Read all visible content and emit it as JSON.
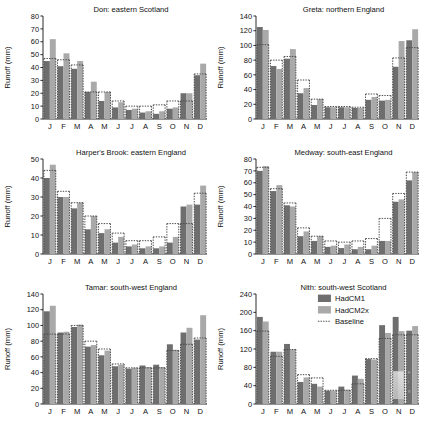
{
  "figure": {
    "axis_label": "Runoff (mm)",
    "month_labels": [
      "J",
      "F",
      "M",
      "A",
      "M",
      "J",
      "J",
      "A",
      "S",
      "O",
      "N",
      "D"
    ],
    "colors": {
      "hadcm1": "#6e6e6e",
      "hadcm2x": "#a9a9a9",
      "baseline": "#4a4a4a",
      "axis": "#2b2b2b",
      "background": "#ffffff"
    },
    "legend": {
      "position": "top-right of panel 6",
      "entries": [
        {
          "label": "HadCM1",
          "type": "swatch",
          "color": "#6e6e6e"
        },
        {
          "label": "HadCM2x",
          "type": "swatch",
          "color": "#a9a9a9"
        },
        {
          "label": "Baseline",
          "type": "dotted-line",
          "color": "#4a4a4a"
        }
      ]
    },
    "edge_caption_lines": [
      "F",
      "i",
      "g",
      "."
    ]
  },
  "chart_data": [
    {
      "type": "bar",
      "panel": 1,
      "title": "Don: eastern Scotland",
      "xlabel": "",
      "ylabel": "Runoff (mm)",
      "ylim": [
        0,
        80
      ],
      "yticks": [
        0,
        10,
        20,
        30,
        40,
        50,
        60,
        70,
        80
      ],
      "grid": false,
      "categories": [
        "J",
        "F",
        "M",
        "A",
        "M",
        "J",
        "J",
        "A",
        "S",
        "O",
        "N",
        "D"
      ],
      "series": [
        {
          "name": "HadCM1",
          "values": [
            45,
            41,
            39,
            21,
            14,
            9,
            7,
            5,
            4,
            8,
            20,
            34
          ]
        },
        {
          "name": "HadCM2x",
          "values": [
            62,
            51,
            45,
            29,
            21,
            13,
            8,
            6,
            6,
            9,
            20,
            43
          ]
        }
      ],
      "baseline": {
        "name": "Baseline",
        "values": [
          47,
          46,
          42,
          21,
          21,
          14,
          10,
          10,
          11,
          14,
          14,
          35
        ]
      }
    },
    {
      "type": "bar",
      "panel": 2,
      "title": "Greta: northern England",
      "xlabel": "",
      "ylabel": "Runoff (mm)",
      "ylim": [
        0,
        140
      ],
      "yticks": [
        0,
        20,
        40,
        60,
        80,
        100,
        120,
        140
      ],
      "grid": false,
      "categories": [
        "J",
        "F",
        "M",
        "A",
        "M",
        "J",
        "J",
        "A",
        "S",
        "O",
        "N",
        "D"
      ],
      "series": [
        {
          "name": "HadCM1",
          "values": [
            125,
            72,
            82,
            35,
            19,
            16,
            16,
            15,
            26,
            25,
            71,
            107
          ]
        },
        {
          "name": "HadCM2x",
          "values": [
            121,
            68,
            95,
            42,
            27,
            16,
            16,
            15,
            30,
            26,
            106,
            122
          ]
        }
      ],
      "baseline": {
        "name": "Baseline",
        "values": [
          101,
          80,
          85,
          53,
          27,
          17,
          17,
          16,
          34,
          32,
          83,
          97
        ]
      }
    },
    {
      "type": "bar",
      "panel": 3,
      "title": "Harper's Brook: eastern England",
      "xlabel": "",
      "ylabel": "Runoff (mm)",
      "ylim": [
        0,
        50
      ],
      "yticks": [
        0,
        10,
        20,
        30,
        40,
        50
      ],
      "grid": false,
      "categories": [
        "J",
        "F",
        "M",
        "A",
        "M",
        "J",
        "J",
        "A",
        "S",
        "O",
        "N",
        "D"
      ],
      "series": [
        {
          "name": "HadCM1",
          "values": [
            40,
            30,
            24,
            13,
            11,
            6,
            4,
            3,
            3,
            6,
            25,
            26
          ]
        },
        {
          "name": "HadCM2x",
          "values": [
            47,
            30,
            27,
            20,
            13,
            9,
            5,
            4,
            4,
            9,
            26,
            36
          ]
        }
      ],
      "baseline": {
        "name": "Baseline",
        "values": [
          44,
          33,
          27,
          20,
          16,
          11,
          7,
          7,
          9,
          16,
          16,
          32
        ]
      }
    },
    {
      "type": "bar",
      "panel": 4,
      "title": "Medway: south-east England",
      "xlabel": "",
      "ylabel": "Runoff (mm)",
      "ylim": [
        0,
        80
      ],
      "yticks": [
        0,
        10,
        20,
        30,
        40,
        50,
        60,
        70,
        80
      ],
      "grid": false,
      "categories": [
        "J",
        "F",
        "M",
        "A",
        "M",
        "J",
        "J",
        "A",
        "S",
        "O",
        "N",
        "D"
      ],
      "series": [
        {
          "name": "HadCM1",
          "values": [
            70,
            53,
            41,
            15,
            11,
            6,
            5,
            4,
            4,
            11,
            44,
            62
          ]
        },
        {
          "name": "HadCM2x",
          "values": [
            74,
            58,
            40,
            19,
            15,
            7,
            8,
            6,
            7,
            11,
            46,
            69
          ]
        }
      ],
      "baseline": {
        "name": "Baseline",
        "values": [
          73,
          55,
          43,
          22,
          15,
          11,
          10,
          11,
          13,
          30,
          51,
          69
        ]
      }
    },
    {
      "type": "bar",
      "panel": 5,
      "title": "Tamar: south-west England",
      "xlabel": "",
      "ylabel": "Runoff (mm)",
      "ylim": [
        0,
        140
      ],
      "yticks": [
        0,
        20,
        40,
        60,
        80,
        100,
        120,
        140
      ],
      "grid": false,
      "categories": [
        "J",
        "F",
        "M",
        "A",
        "M",
        "J",
        "J",
        "A",
        "S",
        "O",
        "N",
        "D"
      ],
      "series": [
        {
          "name": "HadCM1",
          "values": [
            118,
            91,
            98,
            73,
            62,
            48,
            45,
            49,
            50,
            76,
            91,
            82
          ]
        },
        {
          "name": "HadCM2x",
          "values": [
            125,
            92,
            101,
            75,
            68,
            50,
            46,
            47,
            47,
            69,
            97,
            113
          ]
        }
      ],
      "baseline": {
        "name": "Baseline",
        "values": [
          89,
          89,
          100,
          80,
          70,
          51,
          46,
          46,
          46,
          68,
          76,
          84
        ]
      }
    },
    {
      "type": "bar",
      "panel": 6,
      "title": "Nith: south-west Scotland",
      "xlabel": "",
      "ylabel": "Runoff (mm)",
      "ylim": [
        0,
        240
      ],
      "yticks": [
        0,
        40,
        80,
        120,
        160,
        200,
        240
      ],
      "grid": false,
      "categories": [
        "J",
        "F",
        "M",
        "A",
        "M",
        "J",
        "J",
        "A",
        "S",
        "O",
        "N",
        "D"
      ],
      "series": [
        {
          "name": "HadCM1",
          "values": [
            190,
            114,
            131,
            48,
            44,
            29,
            38,
            62,
            98,
            172,
            190,
            160
          ]
        },
        {
          "name": "HadCM2x",
          "values": [
            180,
            114,
            119,
            58,
            38,
            29,
            31,
            55,
            97,
            155,
            159,
            170
          ]
        }
      ],
      "baseline": {
        "name": "Baseline",
        "values": [
          159,
          104,
          119,
          64,
          57,
          30,
          30,
          44,
          99,
          143,
          151,
          151
        ]
      }
    }
  ]
}
